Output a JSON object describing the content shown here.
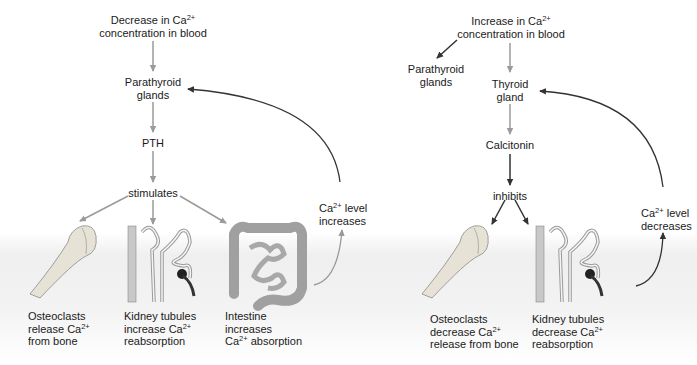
{
  "left_panel": {
    "trigger": {
      "line1_pre": "Decrease in Ca",
      "line1_sup": "2+",
      "line2": "concentration in blood"
    },
    "gland": {
      "line1": "Parathyroid",
      "line2": "glands"
    },
    "hormone": "PTH",
    "action": "stimulates",
    "feedback": {
      "line1_pre": "Ca",
      "line1_sup": "2+",
      "line1_post": " level",
      "line2": "increases"
    },
    "targets": [
      {
        "name": "bone",
        "line1": "Osteoclasts",
        "line2_pre": "release Ca",
        "line2_sup": "2+",
        "line3": "from bone"
      },
      {
        "name": "kidney",
        "line1": "Kidney tubules",
        "line2_pre": "increase Ca",
        "line2_sup": "2+",
        "line3": "reabsorption"
      },
      {
        "name": "intestine",
        "line1": "Intestine",
        "line2_pre": "increases",
        "line2_sup": "",
        "line3_pre": "Ca",
        "line3_sup": "2+",
        "line3_post": " absorption"
      }
    ]
  },
  "right_panel": {
    "trigger": {
      "line1_pre": "Increase in Ca",
      "line1_sup": "2+",
      "line2": "concentration in blood"
    },
    "side_gland": {
      "line1": "Parathyroid",
      "line2": "glands"
    },
    "gland": {
      "line1": "Thyroid",
      "line2": "gland"
    },
    "hormone": "Calcitonin",
    "action": "inhibits",
    "feedback": {
      "line1_pre": "Ca",
      "line1_sup": "2+",
      "line1_post": " level",
      "line2": "decreases"
    },
    "targets": [
      {
        "name": "bone",
        "line1": "Osteoclasts",
        "line2_pre": "decrease Ca",
        "line2_sup": "2+",
        "line3": "release from bone"
      },
      {
        "name": "kidney",
        "line1": "Kidney tubules",
        "line2_pre": "decrease Ca",
        "line2_sup": "2+",
        "line3": "reabsorption"
      }
    ]
  },
  "colors": {
    "gray_arrow": "#9a9a9a",
    "dark_arrow": "#333333",
    "bone": "#e6e3d6",
    "tissue": "#bdbdbd",
    "intestine": "#a8a8a8"
  }
}
